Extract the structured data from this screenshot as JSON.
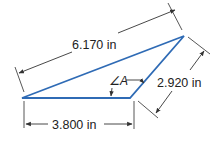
{
  "diagram": {
    "type": "triangle-dimension-drawing",
    "colors": {
      "triangle_stroke": "#2f6bb5",
      "dimension_lines": "#333333",
      "text": "#222222",
      "background": "#ffffff"
    },
    "triangle": {
      "vertices": {
        "left": [
          22,
          98
        ],
        "bottom_right": [
          130,
          98
        ],
        "top_right": [
          184,
          36
        ]
      }
    },
    "dimensions": {
      "long_side": {
        "label": "6.170 in",
        "value": 6.17,
        "unit": "in"
      },
      "right_side": {
        "label": "2.920 in",
        "value": 2.92,
        "unit": "in"
      },
      "bottom_side": {
        "label": "3.800 in",
        "value": 3.8,
        "unit": "in"
      }
    },
    "angle": {
      "symbol": "∠",
      "name": "A",
      "label": "∠A"
    }
  }
}
